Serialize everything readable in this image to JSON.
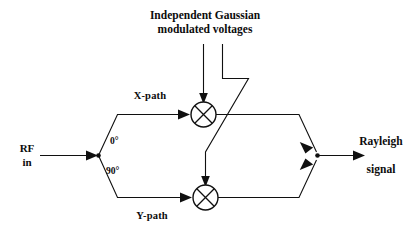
{
  "diagram": {
    "title_lines": [
      "Independent Gaussian",
      "modulated voltages"
    ],
    "input_label_lines": [
      "RF",
      "in"
    ],
    "output_label_lines": [
      "Rayleigh",
      "signal"
    ],
    "branch_labels": {
      "upper_phase": "0°",
      "lower_phase": "90°",
      "upper_path": "X-path",
      "lower_path": "Y-path"
    },
    "mixers": [
      {
        "name": "x-path-mixer",
        "symbol": "⊗"
      },
      {
        "name": "y-path-mixer",
        "symbol": "⊗"
      }
    ],
    "colors": {
      "background": "#ffffff",
      "ink": "#101010",
      "wire": "#181818"
    }
  }
}
